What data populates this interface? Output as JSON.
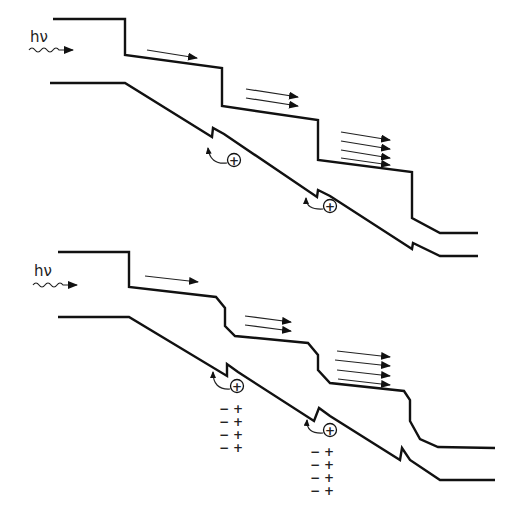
{
  "diagram": {
    "type": "staircase band diagram",
    "panels": [
      {
        "id": "top",
        "photon_label": "hν",
        "hole_symbol": "+",
        "electron_arrow_groups": [
          1,
          2,
          4
        ],
        "hole_count": 2,
        "charge_dipoles": []
      },
      {
        "id": "bottom",
        "photon_label": "hν",
        "hole_symbol": "+",
        "electron_arrow_groups": [
          1,
          2,
          4
        ],
        "hole_count": 2,
        "charge_dipoles": [
          {
            "rows": 4,
            "negative": "−",
            "positive": "+"
          },
          {
            "rows": 4,
            "negative": "−",
            "positive": "+"
          }
        ]
      }
    ]
  }
}
